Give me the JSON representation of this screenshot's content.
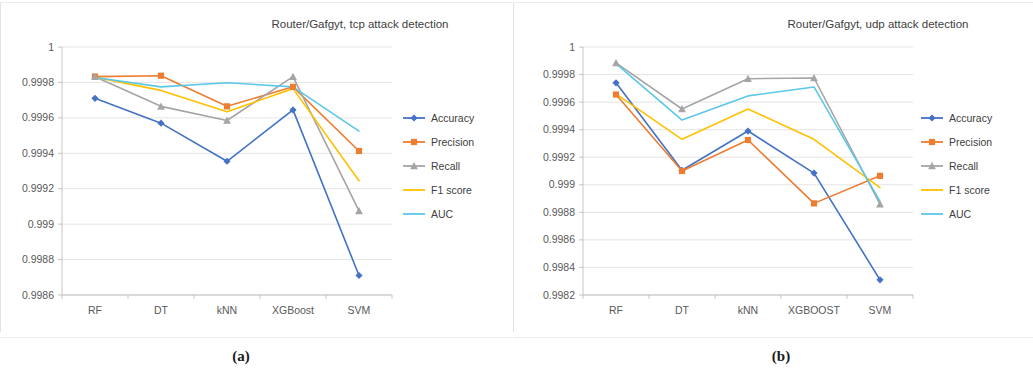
{
  "figure": {
    "caption_a": "(a)",
    "caption_b": "(b)"
  },
  "colors": {
    "accuracy": "#4472c4",
    "precision": "#ed7d31",
    "recall": "#a5a5a5",
    "f1_score": "#ffc000",
    "auc": "#5bc8e8",
    "gridline": "#d9d9d9",
    "axis": "#b8b8b8",
    "text": "#404040",
    "background": "#ffffff"
  },
  "chart_data": [
    {
      "id": "chart-a",
      "type": "line",
      "title": "Router/Gafgyt, tcp attack detection",
      "xlabel": "",
      "ylabel": "",
      "categories": [
        "RF",
        "DT",
        "kNN",
        "XGBoost",
        "SVM"
      ],
      "ylim": [
        0.9986,
        1.0
      ],
      "ytick_step": 0.0002,
      "yticks": [
        "0.9986",
        "0.9988",
        "0.999",
        "0.9992",
        "0.9994",
        "0.9996",
        "0.9998",
        "1"
      ],
      "ytick_values": [
        0.9986,
        0.9988,
        0.999,
        0.9992,
        0.9994,
        0.9996,
        0.9998,
        1.0
      ],
      "grid": true,
      "legend_position": "right",
      "series": [
        {
          "name": "Accuracy",
          "color": "#4472c4",
          "marker": "diamond",
          "values": [
            0.99971,
            0.99957,
            0.999355,
            0.999645,
            0.99871
          ]
        },
        {
          "name": "Precision",
          "color": "#ed7d31",
          "marker": "square",
          "values": [
            0.999833,
            0.999838,
            0.999665,
            0.999775,
            0.999413
          ]
        },
        {
          "name": "Recall",
          "color": "#a5a5a5",
          "marker": "triangle",
          "values": [
            0.999832,
            0.999665,
            0.999585,
            0.999833,
            0.999075
          ]
        },
        {
          "name": "F1 score",
          "color": "#ffc000",
          "marker": "none",
          "values": [
            0.99983,
            0.999755,
            0.999635,
            0.999765,
            0.999245
          ]
        },
        {
          "name": "AUC",
          "color": "#5bc8e8",
          "marker": "none",
          "values": [
            0.999828,
            0.999775,
            0.999798,
            0.999775,
            0.999525
          ]
        }
      ]
    },
    {
      "id": "chart-b",
      "type": "line",
      "title": "Router/Gafgyt, udp attack detection",
      "xlabel": "",
      "ylabel": "",
      "categories": [
        "RF",
        "DT",
        "kNN",
        "XGBOOST",
        "SVM"
      ],
      "ylim": [
        0.9982,
        1.0
      ],
      "ytick_step": 0.0002,
      "yticks": [
        "0.9982",
        "0.9984",
        "0.9986",
        "0.9988",
        "0.999",
        "0.9992",
        "0.9994",
        "0.9996",
        "0.9998",
        "1"
      ],
      "ytick_values": [
        0.9982,
        0.9984,
        0.9986,
        0.9988,
        0.999,
        0.9992,
        0.9994,
        0.9996,
        0.9998,
        1.0
      ],
      "grid": true,
      "legend_position": "right",
      "series": [
        {
          "name": "Accuracy",
          "color": "#4472c4",
          "marker": "diamond",
          "values": [
            0.99974,
            0.999105,
            0.99939,
            0.999085,
            0.99831
          ]
        },
        {
          "name": "Precision",
          "color": "#ed7d31",
          "marker": "square",
          "values": [
            0.999655,
            0.9991,
            0.999325,
            0.998865,
            0.999065
          ]
        },
        {
          "name": "Recall",
          "color": "#a5a5a5",
          "marker": "triangle",
          "values": [
            0.999885,
            0.99955,
            0.99977,
            0.999775,
            0.99886
          ]
        },
        {
          "name": "F1 score",
          "color": "#ffc000",
          "marker": "none",
          "values": [
            0.99966,
            0.99933,
            0.99955,
            0.99933,
            0.99898
          ]
        },
        {
          "name": "AUC",
          "color": "#5bc8e8",
          "marker": "none",
          "values": [
            0.99988,
            0.99947,
            0.999645,
            0.99971,
            0.99888
          ]
        }
      ]
    }
  ]
}
